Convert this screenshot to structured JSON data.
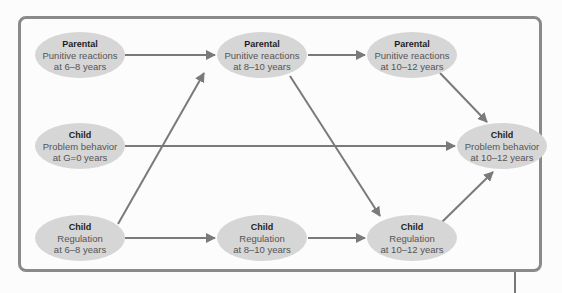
{
  "diagram": {
    "colors": {
      "node_fill": "#d6d6d6",
      "edge": "#7a7a7a",
      "frame": "#8a8a8a"
    },
    "nodes": {
      "parental_6_8": {
        "title": "Parental",
        "line1": "Punitive reactions",
        "line2": "at 6–8 years"
      },
      "parental_8_10": {
        "title": "Parental",
        "line1": "Punitive reactions",
        "line2": "at 8–10 years"
      },
      "parental_10_12": {
        "title": "Parental",
        "line1": "Punitive reactions",
        "line2": "at 10–12 years"
      },
      "child_problem_0": {
        "title": "Child",
        "line1": "Problem behavior",
        "line2": "at G=0 years"
      },
      "child_problem_10_12": {
        "title": "Child",
        "line1": "Problem behavior",
        "line2": "at 10–12 years"
      },
      "child_reg_6_8": {
        "title": "Child",
        "line1": "Regulation",
        "line2": "at 6–8 years"
      },
      "child_reg_8_10": {
        "title": "Child",
        "line1": "Regulation",
        "line2": "at 8–10 years"
      },
      "child_reg_10_12": {
        "title": "Child",
        "line1": "Regulation",
        "line2": "at 10–12 years"
      }
    },
    "edges": [
      {
        "from": "parental_6_8",
        "to": "parental_8_10"
      },
      {
        "from": "parental_8_10",
        "to": "parental_10_12"
      },
      {
        "from": "parental_10_12",
        "to": "child_problem_10_12"
      },
      {
        "from": "parental_8_10",
        "to": "child_reg_10_12"
      },
      {
        "from": "child_problem_0",
        "to": "child_problem_10_12"
      },
      {
        "from": "child_reg_6_8",
        "to": "parental_8_10"
      },
      {
        "from": "child_reg_6_8",
        "to": "child_reg_8_10"
      },
      {
        "from": "child_reg_8_10",
        "to": "child_reg_10_12"
      },
      {
        "from": "child_reg_10_12",
        "to": "child_problem_10_12"
      }
    ]
  }
}
